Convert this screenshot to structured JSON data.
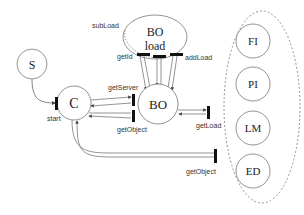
{
  "nodes": {
    "s": {
      "label": "S"
    },
    "c": {
      "label": "C"
    },
    "bo": {
      "label": "BO"
    },
    "bo_load": {
      "label_line1": "BO",
      "label_line2": "load"
    },
    "fi": {
      "label": "FI"
    },
    "pi": {
      "label": "PI"
    },
    "lm": {
      "label": "LM"
    },
    "ed": {
      "label": "ED"
    }
  },
  "ports": {
    "start": "start",
    "getServer": "getServer",
    "getObject_bo": "getObject",
    "getId": "getId",
    "addLoad": "addLoad",
    "subLoad": "subLoad",
    "getLoad": "getLoad",
    "getObject_group": "getObject"
  },
  "colors": {
    "stroke": "#666666",
    "port": "#111111",
    "text": "#222222"
  }
}
